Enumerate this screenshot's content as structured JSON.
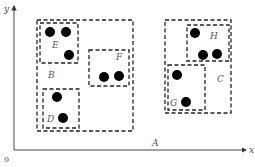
{
  "axes": {
    "x_label": "x",
    "y_label": "y",
    "origin_label": "0",
    "color": "#333333"
  },
  "regions": [
    {
      "id": "A",
      "label": "A",
      "kind": "whole-space",
      "label_pos": [
        152,
        146
      ]
    },
    {
      "id": "B",
      "label": "B",
      "rect": [
        37,
        20,
        96,
        111
      ],
      "label_pos": [
        48,
        78
      ]
    },
    {
      "id": "C",
      "label": "C",
      "rect": [
        165,
        20,
        66,
        93
      ],
      "label_pos": [
        217,
        82
      ]
    },
    {
      "id": "D",
      "label": "D",
      "rect": [
        43,
        89,
        36,
        39
      ],
      "label_pos": [
        47,
        122
      ]
    },
    {
      "id": "E",
      "label": "E",
      "rect": [
        40,
        23,
        38,
        40
      ],
      "label_pos": [
        52,
        48
      ]
    },
    {
      "id": "F",
      "label": "F",
      "rect": [
        89,
        50,
        40,
        36
      ],
      "label_pos": [
        116,
        60
      ]
    },
    {
      "id": "G",
      "label": "G",
      "rect": [
        168,
        65,
        37,
        45
      ],
      "label_pos": [
        170,
        106
      ]
    },
    {
      "id": "H",
      "label": "H",
      "rect": [
        187,
        25,
        42,
        36
      ],
      "label_pos": [
        210,
        39
      ]
    }
  ],
  "points": [
    {
      "region": "E",
      "x": 50,
      "y": 32
    },
    {
      "region": "E",
      "x": 66,
      "y": 32
    },
    {
      "region": "E",
      "x": 69,
      "y": 55
    },
    {
      "region": "F",
      "x": 104,
      "y": 77
    },
    {
      "region": "F",
      "x": 119,
      "y": 76
    },
    {
      "region": "D",
      "x": 57,
      "y": 97
    },
    {
      "region": "D",
      "x": 63,
      "y": 118
    },
    {
      "region": "H",
      "x": 195,
      "y": 33
    },
    {
      "region": "H",
      "x": 203,
      "y": 55
    },
    {
      "region": "H",
      "x": 217,
      "y": 54
    },
    {
      "region": "G",
      "x": 177,
      "y": 75
    },
    {
      "region": "G",
      "x": 186,
      "y": 102
    }
  ],
  "style": {
    "dot_color": "#000000",
    "box_color": "#222222",
    "label_color": "#555555"
  }
}
